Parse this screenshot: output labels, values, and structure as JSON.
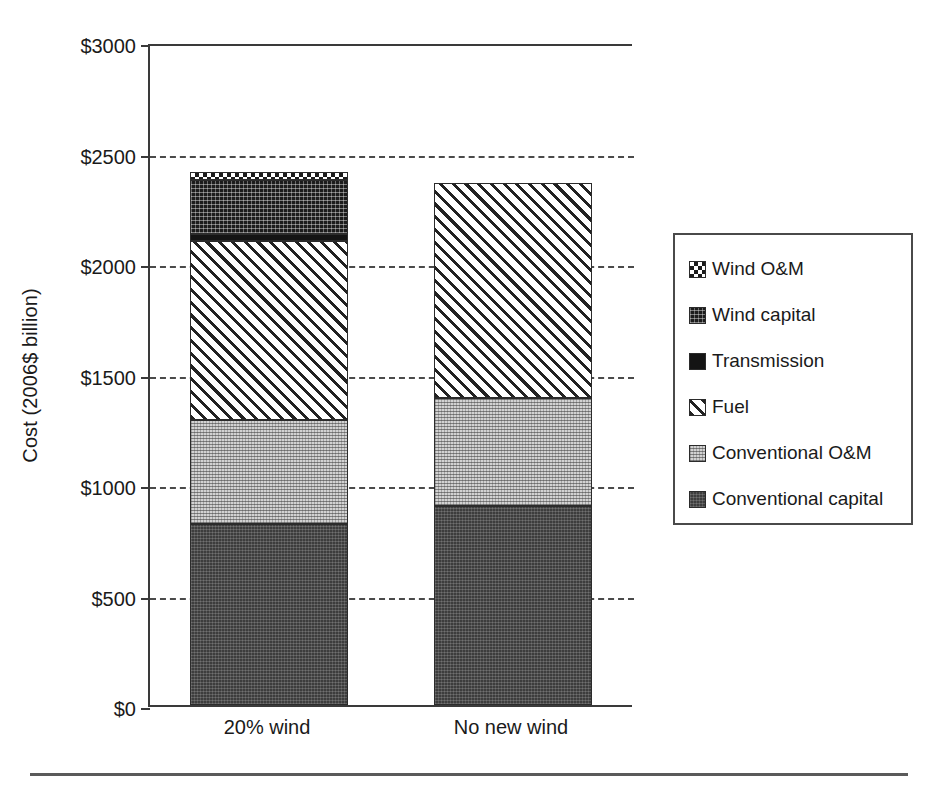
{
  "chart_data": {
    "type": "bar",
    "stacked": true,
    "title": "",
    "xlabel": "",
    "ylabel": "Cost (2006$ billion)",
    "categories": [
      "20% wind",
      "No new wind"
    ],
    "ylim": [
      0,
      3000
    ],
    "ytick_values": [
      0,
      500,
      1000,
      1500,
      2000,
      2500,
      3000
    ],
    "ytick_labels": [
      "$0",
      "$500",
      "$1000",
      "$1500",
      "$2000",
      "$2500",
      "$3000"
    ],
    "grid": "horizontal-dashed",
    "legend_position": "right-outside",
    "series": [
      {
        "name": "Conventional capital",
        "fill": "conv-capital",
        "values": [
          820,
          900
        ]
      },
      {
        "name": "Conventional O&M",
        "fill": "conv-om",
        "values": [
          470,
          490
        ]
      },
      {
        "name": "Fuel",
        "fill": "fuel",
        "values": [
          810,
          970
        ]
      },
      {
        "name": "Transmission",
        "fill": "transmission",
        "values": [
          30,
          0
        ]
      },
      {
        "name": "Wind capital",
        "fill": "wind-capital",
        "values": [
          245,
          0
        ]
      },
      {
        "name": "Wind O&M",
        "fill": "wind-om",
        "values": [
          35,
          0
        ]
      }
    ],
    "totals": [
      2410,
      2360
    ],
    "legend_order": [
      "Wind O&M",
      "Wind capital",
      "Transmission",
      "Fuel",
      "Conventional O&M",
      "Conventional capital"
    ]
  },
  "axis": {
    "y_title": "Cost (2006$ billion)",
    "ticks": [
      {
        "label": "$3000",
        "value": 3000
      },
      {
        "label": "$2500",
        "value": 2500
      },
      {
        "label": "$2000",
        "value": 2000
      },
      {
        "label": "$1500",
        "value": 1500
      },
      {
        "label": "$1000",
        "value": 1000
      },
      {
        "label": "$500",
        "value": 500
      },
      {
        "label": "$0",
        "value": 0
      }
    ],
    "categories": [
      {
        "label": "20% wind"
      },
      {
        "label": "No new wind"
      }
    ]
  },
  "legend": {
    "items": [
      {
        "label": "Wind O&M",
        "swatch": "wind-om"
      },
      {
        "label": "Wind capital",
        "swatch": "wind-capital"
      },
      {
        "label": "Transmission",
        "swatch": "transmission"
      },
      {
        "label": "Fuel",
        "swatch": "fuel"
      },
      {
        "label": "Conventional O&M",
        "swatch": "conv-om"
      },
      {
        "label": "Conventional capital",
        "swatch": "conv-capital"
      }
    ]
  },
  "colors": {
    "axis": "#3a3a3a",
    "gridline": "#4a4a4a",
    "text": "#1a1a1a",
    "conv_capital": "#3d3d3d",
    "conv_om": "#d2d2d2",
    "fuel": "#ffffff",
    "transmission": "#141414",
    "wind_capital": "#1c1c1c",
    "wind_om": "#ffffff"
  }
}
